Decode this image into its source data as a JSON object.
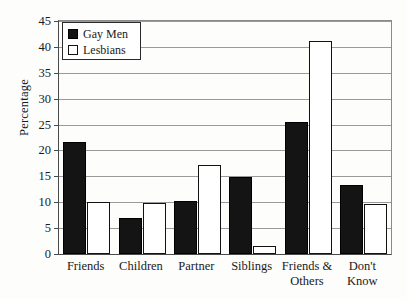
{
  "chart_data": {
    "type": "bar",
    "title": "",
    "subtitle": "",
    "xlabel": "",
    "ylabel": "Percentage",
    "ylim": [
      0,
      45
    ],
    "ytick_values": [
      0,
      5,
      10,
      15,
      20,
      25,
      30,
      35,
      40,
      45
    ],
    "ytick_labels": [
      "0",
      "5",
      "10",
      "15",
      "20",
      "25",
      "30",
      "35",
      "40",
      "45"
    ],
    "grid": true,
    "legend_position": "upper-left-inside",
    "categories": [
      "Friends",
      "Children",
      "Partner",
      "Siblings",
      "Friends &\nOthers",
      "Don't\nKnow"
    ],
    "series": [
      {
        "name": "Gay Men",
        "color": "#141414",
        "values": [
          21.7,
          7.0,
          10.2,
          14.8,
          25.5,
          13.3
        ]
      },
      {
        "name": "Lesbians",
        "color": "#ffffff",
        "values": [
          10.0,
          9.8,
          17.1,
          1.6,
          41.2,
          9.6
        ]
      }
    ]
  },
  "legend": {
    "items": [
      {
        "label": "Gay Men",
        "swatch": "filled-black-square"
      },
      {
        "label": "Lesbians",
        "swatch": "outlined-white-square"
      }
    ]
  },
  "colors": {
    "gay_men": "#141414",
    "lesbians": "#ffffff",
    "axis": "#4a4a4a",
    "gridline": "#9a9a9a",
    "text": "#1a1a1a",
    "background": "#fdfdfc"
  }
}
